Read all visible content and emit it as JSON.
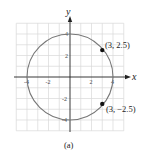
{
  "figure": {
    "caption": "(a)",
    "axes": {
      "x_label": "x",
      "y_label": "y",
      "x_ticks": [
        "-4",
        "-2",
        "2",
        "4"
      ],
      "y_ticks": [
        "4",
        "2",
        "-2",
        "-4"
      ],
      "range": [
        -5,
        5
      ]
    },
    "circle": {
      "center": [
        0,
        0
      ],
      "radius": 4,
      "color": "#777777"
    },
    "points": [
      {
        "x": 3,
        "y": 2.5,
        "label": "(3, 2.5)"
      },
      {
        "x": 3,
        "y": -2.5,
        "label": "(3, −2.5)"
      }
    ],
    "grid_color": "#d8d8d8",
    "axis_color": "#222222"
  }
}
